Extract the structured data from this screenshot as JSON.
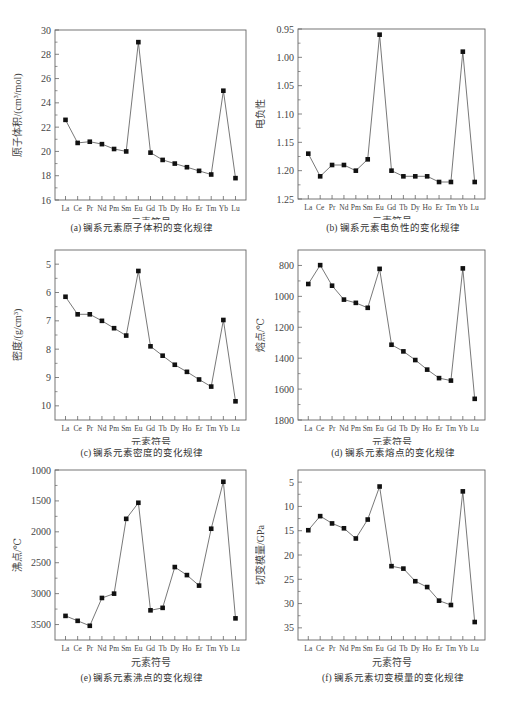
{
  "elements": [
    "La",
    "Ce",
    "Pr",
    "Nd",
    "Pm",
    "Sm",
    "Eu",
    "Gd",
    "Tb",
    "Dy",
    "Ho",
    "Er",
    "Tm",
    "Yb",
    "Lu"
  ],
  "chart_data": [
    {
      "id": "a",
      "type": "line",
      "title": "(a) 镧系元素原子体积的变化规律",
      "xlabel": "元素符号",
      "ylabel": "原子体积/(cm³/mol)",
      "categories": [
        "La",
        "Ce",
        "Pr",
        "Nd",
        "Pm",
        "Sm",
        "Eu",
        "Gd",
        "Tb",
        "Dy",
        "Ho",
        "Er",
        "Tm",
        "Yb",
        "Lu"
      ],
      "values": [
        22.6,
        20.7,
        20.8,
        20.6,
        20.2,
        20.0,
        29.0,
        19.9,
        19.3,
        19.0,
        18.7,
        18.4,
        18.1,
        25.0,
        17.8
      ],
      "ylim": [
        16,
        30
      ],
      "yticks": [
        16,
        18,
        20,
        22,
        24,
        26,
        28,
        30
      ],
      "ytick_labels": [
        "16",
        "18",
        "20",
        "22",
        "24",
        "26",
        "28",
        "30"
      ],
      "inverted": false,
      "grid": false
    },
    {
      "id": "b",
      "type": "line",
      "title": "(b) 镧系元素电负性的变化规律",
      "xlabel": "元素符号",
      "ylabel": "电负性",
      "categories": [
        "La",
        "Ce",
        "Pr",
        "Nd",
        "Pm",
        "Sm",
        "Eu",
        "Gd",
        "Tb",
        "Dy",
        "Ho",
        "Er",
        "Tm",
        "Yb",
        "Lu"
      ],
      "values": [
        1.17,
        1.21,
        1.19,
        1.19,
        1.2,
        1.18,
        0.96,
        1.2,
        1.21,
        1.21,
        1.21,
        1.22,
        1.22,
        0.99,
        1.22
      ],
      "ylim": [
        0.95,
        1.25
      ],
      "yticks": [
        0.95,
        1.0,
        1.05,
        1.1,
        1.15,
        1.2,
        1.25
      ],
      "ytick_labels": [
        "0.95",
        "1.00",
        "1.05",
        "1.10",
        "1.15",
        "1.20",
        "1.25"
      ],
      "inverted": true,
      "grid": false
    },
    {
      "id": "c",
      "type": "line",
      "title": "(c) 镧系元素密度的变化规律",
      "xlabel": "元素符号",
      "ylabel": "密度/(g/cm³)",
      "categories": [
        "La",
        "Ce",
        "Pr",
        "Nd",
        "Pm",
        "Sm",
        "Eu",
        "Gd",
        "Tb",
        "Dy",
        "Ho",
        "Er",
        "Tm",
        "Yb",
        "Lu"
      ],
      "values": [
        6.15,
        6.77,
        6.77,
        7.0,
        7.26,
        7.52,
        5.24,
        7.9,
        8.23,
        8.55,
        8.8,
        9.07,
        9.32,
        6.97,
        9.84
      ],
      "ylim": [
        4.5,
        10.5
      ],
      "yticks": [
        5,
        6,
        7,
        8,
        9,
        10
      ],
      "ytick_labels": [
        "5",
        "6",
        "7",
        "8",
        "9",
        "10"
      ],
      "inverted": true,
      "grid": false
    },
    {
      "id": "d",
      "type": "line",
      "title": "(d) 镧系元素熔点的变化规律",
      "xlabel": "元素符号",
      "ylabel": "熔点/℃",
      "categories": [
        "La",
        "Ce",
        "Pr",
        "Nd",
        "Pm",
        "Sm",
        "Eu",
        "Gd",
        "Tb",
        "Dy",
        "Ho",
        "Er",
        "Tm",
        "Yb",
        "Lu"
      ],
      "values": [
        920,
        798,
        931,
        1021,
        1042,
        1074,
        822,
        1313,
        1356,
        1412,
        1474,
        1529,
        1545,
        819,
        1663
      ],
      "ylim": [
        700,
        1800
      ],
      "yticks": [
        800,
        1000,
        1200,
        1400,
        1600,
        1800
      ],
      "ytick_labels": [
        "800",
        "1000",
        "1200",
        "1400",
        "1600",
        "1800"
      ],
      "inverted": true,
      "grid": false
    },
    {
      "id": "e",
      "type": "line",
      "title": "(e) 镧系元素沸点的变化规律",
      "xlabel": "元素符号",
      "ylabel": "沸点/℃",
      "categories": [
        "La",
        "Ce",
        "Pr",
        "Nd",
        "Pm",
        "Sm",
        "Eu",
        "Gd",
        "Tb",
        "Dy",
        "Ho",
        "Er",
        "Tm",
        "Yb",
        "Lu"
      ],
      "values": [
        3360,
        3440,
        3520,
        3070,
        3000,
        1790,
        1530,
        3270,
        3230,
        2570,
        2700,
        2870,
        1950,
        1190,
        3400
      ],
      "ylim": [
        1000,
        3750
      ],
      "yticks": [
        1000,
        1500,
        2000,
        2500,
        3000,
        3500
      ],
      "ytick_labels": [
        "1000",
        "1500",
        "2000",
        "2500",
        "3000",
        "3500"
      ],
      "inverted": true,
      "grid": false
    },
    {
      "id": "f",
      "type": "line",
      "title": "(f) 镧系元素切变模量的变化规律",
      "xlabel": "元素符号",
      "ylabel": "切变模量/GPa",
      "categories": [
        "La",
        "Ce",
        "Pr",
        "Nd",
        "Pm",
        "Sm",
        "Eu",
        "Gd",
        "Tb",
        "Dy",
        "Ho",
        "Er",
        "Tm",
        "Yb",
        "Lu"
      ],
      "values": [
        14.9,
        12.0,
        13.5,
        14.5,
        16.6,
        12.7,
        5.9,
        22.3,
        22.8,
        25.4,
        26.6,
        29.4,
        30.3,
        6.9,
        33.8
      ],
      "ylim": [
        2.5,
        37.5
      ],
      "yticks": [
        5,
        10,
        15,
        20,
        25,
        30,
        35
      ],
      "ytick_labels": [
        "5",
        "10",
        "15",
        "20",
        "25",
        "30",
        "35"
      ],
      "inverted": true,
      "grid": false
    }
  ]
}
